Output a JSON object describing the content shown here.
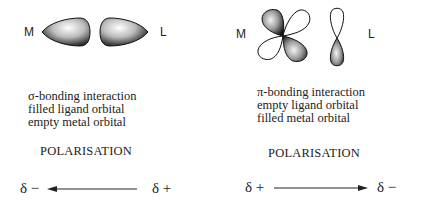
{
  "left_panel": {
    "metal_label": "M",
    "ligand_label": "L",
    "description": [
      "σ-bonding interaction",
      "filled ligand orbital",
      "empty metal orbital"
    ],
    "polarisation_label": "POLARISATION",
    "arrow": {
      "left_label": "δ −",
      "right_label": "δ +",
      "direction": "left"
    }
  },
  "right_panel": {
    "metal_label": "M",
    "ligand_label": "L",
    "description": [
      "π-bonding interaction",
      "empty ligand orbital",
      "filled metal orbital"
    ],
    "polarisation_label": "POLARISATION",
    "arrow": {
      "left_label": "δ +",
      "right_label": "δ −",
      "direction": "right"
    }
  }
}
